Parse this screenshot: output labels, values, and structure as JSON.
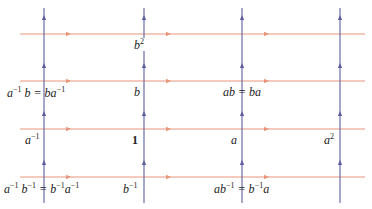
{
  "diagram": {
    "type": "cayley-graph-grid",
    "colors": {
      "horizontal_edge": "#e8957a",
      "vertical_edge": "#5c5f9e",
      "label_text": "#222222",
      "background": "#ffffff"
    },
    "horizontal_lines": [
      {
        "y": 34,
        "x1": 20,
        "x2": 365,
        "arrows_x": [
          68,
          168,
          266
        ]
      },
      {
        "y": 81,
        "x1": 20,
        "x2": 365,
        "arrows_x": [
          68,
          168,
          266
        ]
      },
      {
        "y": 129,
        "x1": 20,
        "x2": 365,
        "arrows_x": [
          68,
          168,
          266
        ]
      },
      {
        "y": 177,
        "x1": 20,
        "x2": 365,
        "arrows_x": [
          68,
          168,
          266
        ]
      }
    ],
    "vertical_lines": [
      {
        "x": 44,
        "y1": 8,
        "y2": 203,
        "arrows_y": [
          18,
          66,
          114,
          163
        ]
      },
      {
        "x": 144,
        "y1": 8,
        "y2": 203,
        "arrows_y": [
          18,
          66,
          114,
          163
        ]
      },
      {
        "x": 242,
        "y1": 8,
        "y2": 203,
        "arrows_y": [
          18,
          66,
          114,
          163
        ]
      },
      {
        "x": 340,
        "y1": 8,
        "y2": 203,
        "arrows_y": [
          18,
          66,
          114,
          163
        ]
      }
    ],
    "labels": {
      "b2": {
        "base": "b",
        "exp": "2"
      },
      "a_inv_b": {
        "text": "a⁻¹ b = ba⁻¹",
        "parts": [
          "a",
          "−1",
          " b = ba",
          "−1"
        ]
      },
      "b": {
        "text": "b"
      },
      "ab": {
        "text": "ab = ba"
      },
      "a_inv": {
        "base": "a",
        "exp": "−1"
      },
      "one": {
        "text": "1"
      },
      "a": {
        "text": "a"
      },
      "a2": {
        "base": "a",
        "exp": "2"
      },
      "a_inv_b_inv": {
        "text": "a⁻¹ b⁻¹ = b⁻¹a⁻¹",
        "parts": [
          "a",
          "−1",
          " b",
          "−1",
          " = b",
          "−1",
          "a",
          "−1"
        ]
      },
      "b_inv": {
        "base": "b",
        "exp": "−1"
      },
      "ab_inv": {
        "text": "ab⁻¹ = b⁻¹a",
        "parts": [
          "ab",
          "−1",
          " = b",
          "−1",
          "a"
        ]
      }
    }
  }
}
